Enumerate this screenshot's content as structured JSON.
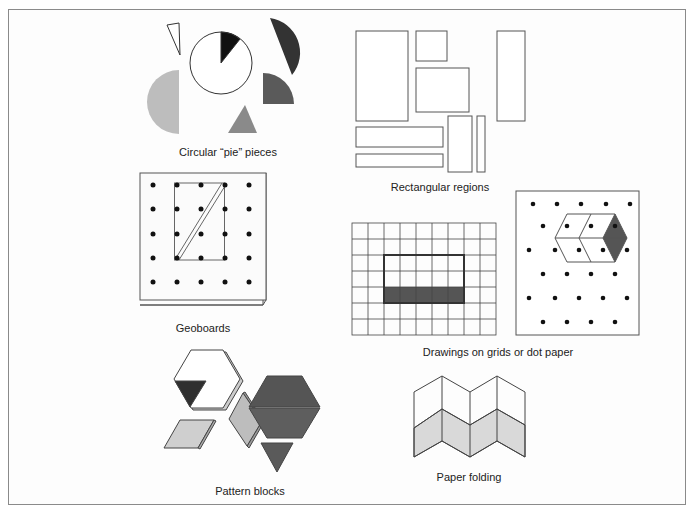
{
  "figure": {
    "panels": [
      {
        "id": "pie",
        "caption": "Circular “pie” pieces"
      },
      {
        "id": "rect",
        "caption": "Rectangular regions"
      },
      {
        "id": "geo",
        "caption": "Geoboards"
      },
      {
        "id": "grid",
        "caption": "Drawings on grids or dot paper"
      },
      {
        "id": "pattern",
        "caption": "Pattern blocks"
      },
      {
        "id": "fold",
        "caption": "Paper folding"
      }
    ],
    "colors": {
      "dark": "#1a1a1a",
      "dark_gray": "#505050",
      "mid_gray": "#6e6e6e",
      "gray": "#8c8c8c",
      "light_gray": "#bdbdbd",
      "pale_gray": "#d9d9d9",
      "line": "#444444"
    }
  }
}
